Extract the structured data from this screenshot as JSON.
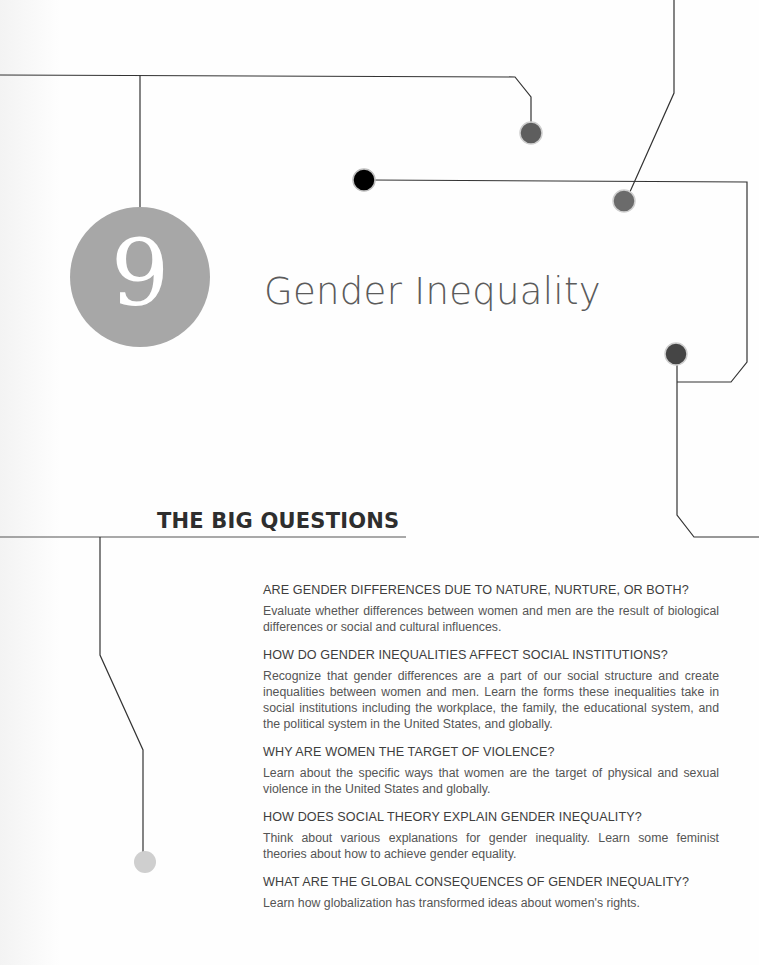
{
  "chapter": {
    "number": "9",
    "title": "Gender Inequality"
  },
  "section": {
    "heading": "THE BIG QUESTIONS"
  },
  "questions": [
    {
      "title": "ARE GENDER DIFFERENCES DUE TO NATURE, NURTURE, OR BOTH?",
      "body": "Evaluate whether differences between women and men are the result of biological differences or social and cultural influences."
    },
    {
      "title": "HOW DO GENDER INEQUALITIES AFFECT SOCIAL INSTITUTIONS?",
      "body": "Recognize that gender differences are a part of our social structure and create inequalities between women and men. Learn the forms these inequalities take in social institutions including the workplace, the family, the educational system, and the political system in the United States, and globally."
    },
    {
      "title": "WHY ARE WOMEN THE TARGET OF VIOLENCE?",
      "body": "Learn about the specific ways that women are the target of physical and sexual violence in the United States and globally."
    },
    {
      "title": "HOW DOES SOCIAL THEORY EXPLAIN GENDER INEQUALITY?",
      "body": "Think about various explanations for gender inequality. Learn some feminist theories about how to achieve gender equality."
    },
    {
      "title": "WHAT ARE THE GLOBAL CONSEQUENCES OF GENDER INEQUALITY?",
      "body": "Learn how globalization has transformed ideas about women's rights."
    }
  ],
  "colors": {
    "chapter_circle": "#a7a7a7",
    "line": "#333333",
    "dot_dark": "#4a4a4a",
    "dot_mid": "#666666",
    "dot_black": "#000000",
    "dot_light": "#cccccc"
  }
}
